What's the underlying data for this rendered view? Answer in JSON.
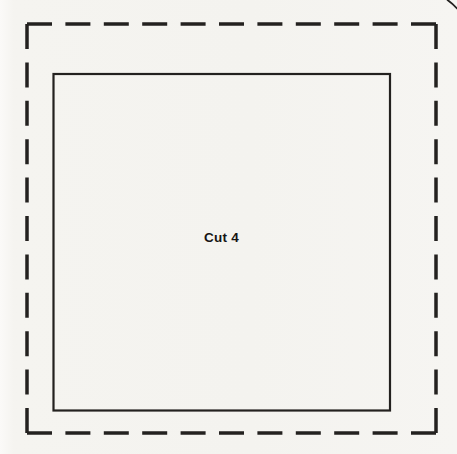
{
  "pattern_piece": {
    "label": "Cut 4",
    "outer_border": "dashed cutting line",
    "inner_border": "solid seam line",
    "colors": {
      "line": "#23211f",
      "paper": "#f4f3ef",
      "text": "#161514"
    }
  }
}
